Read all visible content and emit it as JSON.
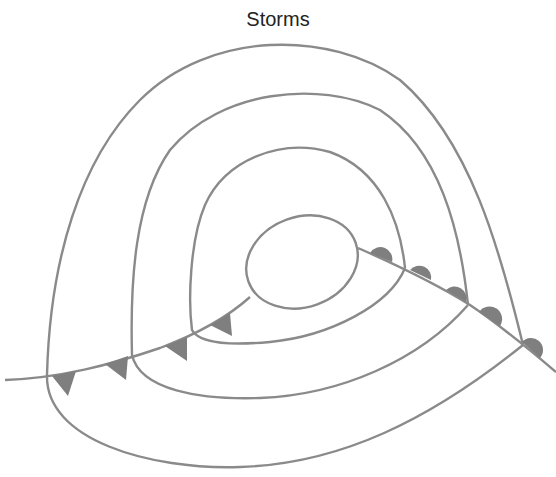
{
  "title": "Storms",
  "colors": {
    "line": "#8a8a8a",
    "symbol_fill": "#7f7f7f",
    "text": "#222222",
    "background": "#ffffff"
  },
  "diagram": {
    "type": "weather-map",
    "isobar_count": 4,
    "fronts": [
      {
        "type": "cold",
        "symbol": "triangle",
        "count": 5
      },
      {
        "type": "warm",
        "symbol": "semicircle",
        "count": 5
      }
    ]
  }
}
